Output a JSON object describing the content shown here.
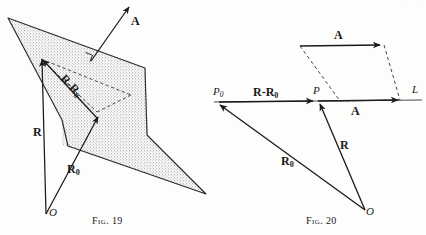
{
  "page": {
    "width": 426,
    "height": 235,
    "background_color": "#fdfdfc",
    "ink_color": "#1a1a1a",
    "plane_fill_color": "#cfcfcf",
    "corner_artifact": "· ·"
  },
  "figures": [
    {
      "id": "fig-19",
      "caption_prefix": "Fig.",
      "caption_number": "19",
      "caption_full": "FIG. 19",
      "description": "Vector R from origin O to a point in an oblique shaded plane, vector R-sub-0 to a reference point in the plane, their difference R-R0 lying in the plane, and normal vector A perpendicular to the plane.",
      "labels": [
        {
          "name": "vector-a-label",
          "text": "A",
          "style": "bold"
        },
        {
          "name": "vector-r-label",
          "text": "R",
          "style": "bold"
        },
        {
          "name": "vector-r0-label",
          "text": "R",
          "subscript": "0",
          "style": "bold"
        },
        {
          "name": "vector-r-minus-r0-label",
          "text": "R-R",
          "subscript": "0",
          "style": "bold",
          "rotated": true
        },
        {
          "name": "origin-label",
          "text": "O",
          "style": "italic"
        }
      ]
    },
    {
      "id": "fig-20",
      "caption_prefix": "Fig.",
      "caption_number": "20",
      "caption_full": "FIG. 20",
      "description": "Line L through points P0 and P, with direction vector A shown both on the line and as a free vector above it forming a dashed parallelogram; position vectors R0 and R drawn from origin O to P0 and P, with the difference R-R0 along the line.",
      "labels": [
        {
          "name": "point-p0-label",
          "text": "P",
          "subscript": "0",
          "style": "italic"
        },
        {
          "name": "point-p-label",
          "text": "P",
          "style": "italic"
        },
        {
          "name": "line-l-label",
          "text": "L",
          "style": "italic"
        },
        {
          "name": "vector-r-minus-r0-label",
          "text": "R-R",
          "subscript": "0",
          "style": "bold"
        },
        {
          "name": "vector-a-top-label",
          "text": "A",
          "style": "bold"
        },
        {
          "name": "vector-a-line-label",
          "text": "A",
          "style": "bold"
        },
        {
          "name": "vector-r-label",
          "text": "R",
          "style": "bold"
        },
        {
          "name": "vector-r0-label",
          "text": "R",
          "subscript": "0",
          "style": "bold"
        },
        {
          "name": "origin-label",
          "text": "O",
          "style": "italic"
        }
      ]
    }
  ]
}
